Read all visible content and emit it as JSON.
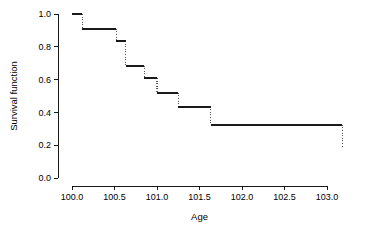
{
  "chart_data": {
    "type": "line",
    "title": "",
    "subtitle": "",
    "xlabel": "Age",
    "ylabel": "Survival function",
    "xlim": [
      99.85,
      103.35
    ],
    "ylim": [
      0.0,
      1.0
    ],
    "grid": false,
    "legend": null,
    "style": "kaplan-meier step function, solid horizontal segments with dotted vertical drops",
    "xticks": [
      "100.0",
      "100.5",
      "101.0",
      "101.5",
      "102.0",
      "102.5",
      "103.0"
    ],
    "xtick_values": [
      100.0,
      100.5,
      101.0,
      101.5,
      102.0,
      102.5,
      103.0
    ],
    "yticks": [
      "0.0",
      "0.2",
      "0.4",
      "0.6",
      "0.8",
      "1.0"
    ],
    "ytick_values": [
      0.0,
      0.2,
      0.4,
      0.6,
      0.8,
      1.0
    ],
    "x": [
      100.0,
      100.12,
      100.52,
      100.63,
      100.85,
      101.0,
      101.25,
      101.63,
      103.18
    ],
    "y": [
      1.0,
      0.91,
      0.835,
      0.685,
      0.61,
      0.52,
      0.435,
      0.325,
      0.18
    ],
    "steps": [
      {
        "x_start": 100.0,
        "x_end": 100.12,
        "value": 1.0
      },
      {
        "x_start": 100.12,
        "x_end": 100.52,
        "value": 0.91
      },
      {
        "x_start": 100.52,
        "x_end": 100.63,
        "value": 0.835
      },
      {
        "x_start": 100.63,
        "x_end": 100.85,
        "value": 0.685
      },
      {
        "x_start": 100.85,
        "x_end": 101.0,
        "value": 0.61
      },
      {
        "x_start": 101.0,
        "x_end": 101.25,
        "value": 0.52
      },
      {
        "x_start": 101.25,
        "x_end": 101.63,
        "value": 0.435
      },
      {
        "x_start": 101.63,
        "x_end": 103.18,
        "value": 0.325
      }
    ],
    "drops": [
      {
        "x": 100.12,
        "y_top": 1.0,
        "y_bottom": 0.91
      },
      {
        "x": 100.52,
        "y_top": 0.91,
        "y_bottom": 0.835
      },
      {
        "x": 100.63,
        "y_top": 0.835,
        "y_bottom": 0.685
      },
      {
        "x": 100.85,
        "y_top": 0.685,
        "y_bottom": 0.61
      },
      {
        "x": 101.0,
        "y_top": 0.61,
        "y_bottom": 0.52
      },
      {
        "x": 101.25,
        "y_top": 0.52,
        "y_bottom": 0.435
      },
      {
        "x": 101.63,
        "y_top": 0.435,
        "y_bottom": 0.325
      },
      {
        "x": 103.18,
        "y_top": 0.325,
        "y_bottom": 0.18
      }
    ],
    "colors": {
      "line": "#1a1a1a",
      "drop": "#555555",
      "axis": "#000000",
      "background": "#ffffff"
    }
  }
}
